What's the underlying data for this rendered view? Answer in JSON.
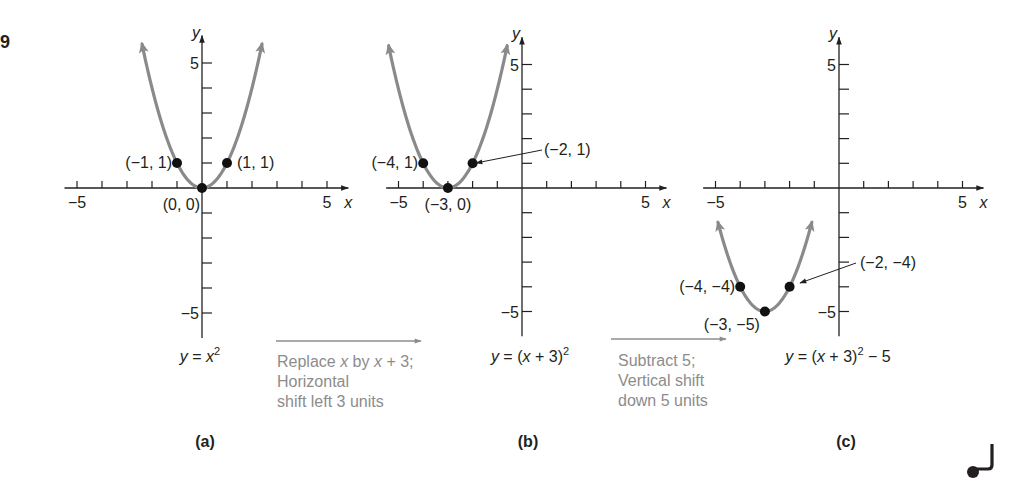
{
  "figure_number_fragment": "9",
  "colors": {
    "axis": "#231f20",
    "curve": "#8a8a8a",
    "point": "#111111",
    "annotation_text": "#8c8c8c",
    "text": "#231f20"
  },
  "chart_data": [
    {
      "type": "line",
      "panel": "(a)",
      "equation": "y = x^2",
      "equation_parts": {
        "lhs": "y = x",
        "sup": "2",
        "tail": ""
      },
      "function": {
        "h": 0,
        "k": 0
      },
      "xlim": [
        -5,
        5
      ],
      "ylim": [
        -5,
        5
      ],
      "xlabel": "x",
      "ylabel": "y",
      "tick_labels": {
        "x_min": "−5",
        "x_max": "5",
        "y_max": "5",
        "y_min": "−5"
      },
      "points": [
        {
          "x": -1,
          "y": 1,
          "label": "(−1, 1)"
        },
        {
          "x": 0,
          "y": 0,
          "label": "(0, 0)"
        },
        {
          "x": 1,
          "y": 1,
          "label": "(1, 1)"
        }
      ],
      "curve_x_range": [
        -2.4,
        2.4
      ],
      "grid": false
    },
    {
      "type": "line",
      "panel": "(b)",
      "equation": "y = (x + 3)^2",
      "equation_parts": {
        "lhs": "y = (x + 3)",
        "sup": "2",
        "tail": ""
      },
      "function": {
        "h": -3,
        "k": 0
      },
      "xlim": [
        -5,
        5
      ],
      "ylim": [
        -5,
        5
      ],
      "xlabel": "x",
      "ylabel": "y",
      "tick_labels": {
        "x_min": "−5",
        "x_max": "5",
        "y_max": "5",
        "y_min": "−5"
      },
      "points": [
        {
          "x": -4,
          "y": 1,
          "label": "(−4, 1)"
        },
        {
          "x": -3,
          "y": 0,
          "label": "(−3, 0)"
        },
        {
          "x": -2,
          "y": 1,
          "label": "(−2, 1)"
        }
      ],
      "curve_x_range": [
        -5.4,
        -0.6
      ],
      "grid": false
    },
    {
      "type": "line",
      "panel": "(c)",
      "equation": "y = (x + 3)^2 − 5",
      "equation_parts": {
        "lhs": "y = (x + 3)",
        "sup": "2",
        "tail": " − 5"
      },
      "function": {
        "h": -3,
        "k": -5
      },
      "xlim": [
        -5,
        5
      ],
      "ylim": [
        -5,
        5
      ],
      "xlabel": "x",
      "ylabel": "y",
      "tick_labels": {
        "x_min": "−5",
        "x_max": "5",
        "y_max": "5",
        "y_min": "−5"
      },
      "points": [
        {
          "x": -4,
          "y": -4,
          "label": "(−4, −4)"
        },
        {
          "x": -3,
          "y": -5,
          "label": "(−3, −5)"
        },
        {
          "x": -2,
          "y": -4,
          "label": "(−2, −4)"
        }
      ],
      "curve_x_range": [
        -4.9,
        -1.1
      ],
      "grid": false
    }
  ],
  "transformations": [
    {
      "lines": [
        "Replace x by x + 3;",
        "Horizontal",
        "shift left 3 units"
      ]
    },
    {
      "lines": [
        "Subtract 5;",
        "Vertical shift",
        "down 5 units"
      ]
    }
  ],
  "panel_labels": [
    "(a)",
    "(b)",
    "(c)"
  ]
}
